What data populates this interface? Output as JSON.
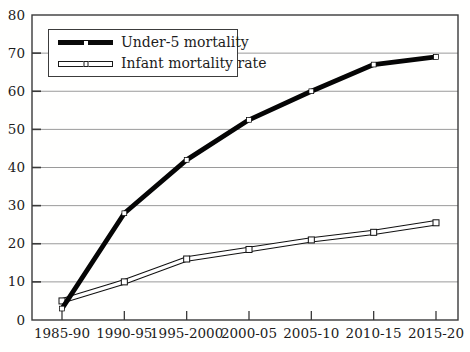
{
  "chart_data": {
    "type": "line",
    "categories": [
      "1985-90",
      "1990-95",
      "1995-2000",
      "2000-05",
      "2005-10",
      "2010-15",
      "2015-20"
    ],
    "series": [
      {
        "name": "Under-5 mortality",
        "values": [
          3,
          28,
          42,
          52.5,
          60,
          67,
          69
        ],
        "line_style": "thick solid black",
        "marker": "small white square"
      },
      {
        "name": "Infant mortality rate",
        "values": [
          5,
          10,
          16,
          18.5,
          21,
          23,
          25.5
        ],
        "line_style": "thin hollow outlined band",
        "marker": "open white square"
      }
    ],
    "title": "",
    "xlabel": "",
    "ylabel": "",
    "ylim": [
      0,
      80
    ],
    "yticks": [
      0,
      10,
      20,
      30,
      40,
      50,
      60,
      70,
      80
    ],
    "grid": "horizontal",
    "frame": true,
    "legend_position": "upper-left inside plot",
    "colors": {
      "series": [
        "#000000",
        "#000000"
      ],
      "grid": "#8f8f8f",
      "frame": "#3a3a3a",
      "background": "#ffffff",
      "text": "#1c1c1c"
    }
  }
}
